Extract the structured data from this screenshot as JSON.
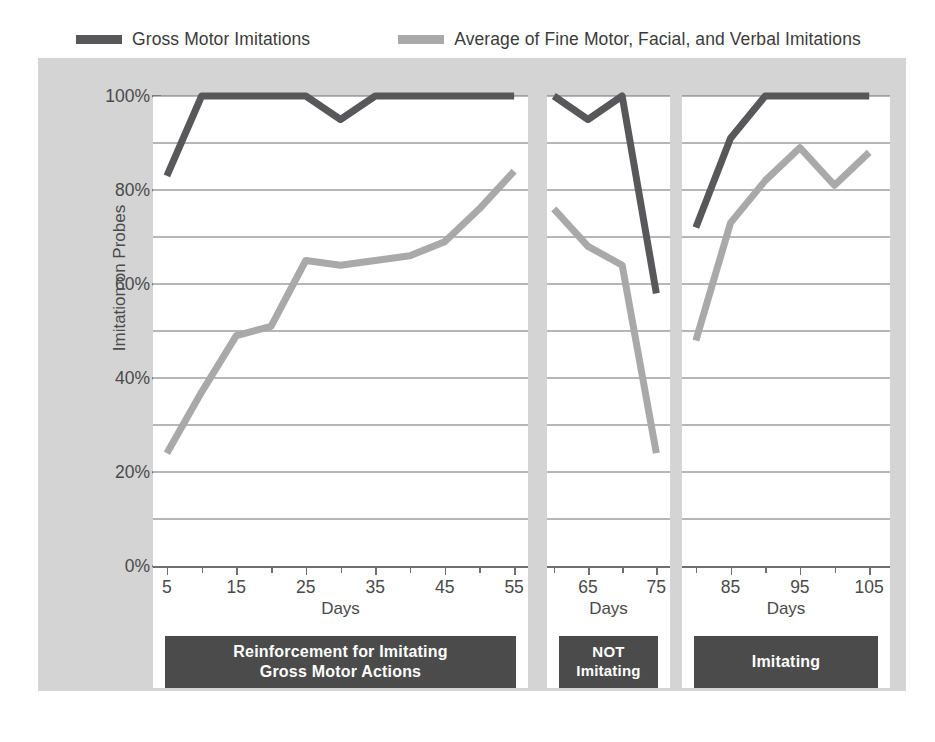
{
  "legend": {
    "items": [
      {
        "label": "Gross Motor Imitations",
        "color": "#58585a",
        "series_key": "gross_motor"
      },
      {
        "label": "Average of Fine Motor, Facial, and Verbal Imitations",
        "color": "#a9a9a9",
        "series_key": "fine_facial_verbal"
      }
    ]
  },
  "axes": {
    "y_title": "Imitation on Probes",
    "y_ticks": [
      "0%",
      "20%",
      "40%",
      "60%",
      "80%",
      "100%"
    ],
    "x_title": "Days"
  },
  "phases": [
    {
      "label_line1": "Reinforcement for Imitating",
      "label_line2": "Gross Motor Actions"
    },
    {
      "label_line1": "NOT",
      "label_line2": "Imitating"
    },
    {
      "label_line1": "Imitating",
      "label_line2": ""
    }
  ],
  "colors": {
    "dark_series": "#58585a",
    "light_series": "#a9a9a9",
    "gridline": "#6e6e6e",
    "frame_background": "#d4d4d4",
    "panel_background": "#ffffff",
    "phase_box": "#4b4b4b",
    "text": "#4a4a4a"
  },
  "chart_data": {
    "type": "line",
    "title": "",
    "xlabel": "Days",
    "ylabel": "Imitation on Probes",
    "ylim": [
      0,
      100
    ],
    "ytick_values": [
      0,
      20,
      40,
      60,
      80,
      100
    ],
    "minor_gridlines_every": 10,
    "grid": true,
    "legend_position": "top",
    "panels": [
      {
        "name": "Reinforcement for Imitating Gross Motor Actions",
        "xlim": [
          3,
          57
        ],
        "xticks_major": [
          5,
          15,
          25,
          35,
          45,
          55
        ],
        "xticks_minor": [
          10,
          20,
          30,
          40,
          50
        ],
        "x": [
          5,
          10,
          15,
          20,
          25,
          30,
          35,
          40,
          45,
          50,
          55
        ],
        "series": [
          {
            "name": "Gross Motor Imitations",
            "color": "#58585a",
            "values": [
              83,
              100,
              100,
              100,
              100,
              95,
              100,
              100,
              100,
              100,
              100
            ]
          },
          {
            "name": "Average of Fine Motor, Facial, and Verbal Imitations",
            "color": "#a9a9a9",
            "values": [
              24,
              37,
              49,
              51,
              65,
              64,
              65,
              66,
              69,
              76,
              84
            ]
          }
        ]
      },
      {
        "name": "NOT Imitating",
        "xlim": [
          59,
          77
        ],
        "xticks_major": [
          65,
          75
        ],
        "xticks_minor": [
          60,
          70
        ],
        "x": [
          60,
          65,
          70,
          75
        ],
        "series": [
          {
            "name": "Gross Motor Imitations",
            "color": "#58585a",
            "values": [
              100,
              95,
              100,
              58
            ]
          },
          {
            "name": "Average of Fine Motor, Facial, and Verbal Imitations",
            "color": "#a9a9a9",
            "values": [
              76,
              68,
              64,
              24
            ]
          }
        ]
      },
      {
        "name": "Imitating",
        "xlim": [
          78,
          108
        ],
        "xticks_major": [
          85,
          95,
          105
        ],
        "xticks_minor": [
          80,
          90,
          100
        ],
        "x": [
          80,
          85,
          90,
          95,
          100,
          105
        ],
        "series": [
          {
            "name": "Gross Motor Imitations",
            "color": "#58585a",
            "values": [
              72,
              91,
              100,
              100,
              100,
              100
            ]
          },
          {
            "name": "Average of Fine Motor, Facial, and Verbal Imitations",
            "color": "#a9a9a9",
            "values": [
              48,
              73,
              82,
              89,
              81,
              88
            ]
          }
        ]
      }
    ]
  }
}
